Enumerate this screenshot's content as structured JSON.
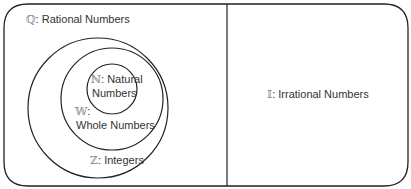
{
  "regions": {
    "rational": {
      "symbol": "ℚ",
      "label": ": Rational Numbers"
    },
    "integers": {
      "symbol": "ℤ",
      "label": ": Integers"
    },
    "whole": {
      "symbol": "𝕎",
      "colon": ":",
      "label": "Whole Numbers"
    },
    "natural": {
      "symbol": "ℕ",
      "label": ": Natural",
      "label2": "Numbers"
    },
    "irrational": {
      "symbol": "𝕀",
      "label": ": Irrational Numbers"
    }
  }
}
